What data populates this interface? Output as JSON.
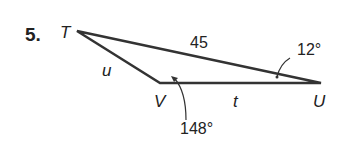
{
  "problem": {
    "number": "5.",
    "vertices": {
      "T": "T",
      "U": "U",
      "V": "V"
    },
    "sides": {
      "TV": "u",
      "VU": "t",
      "TU": "45"
    },
    "angles": {
      "U": "12°",
      "V": "148°"
    }
  }
}
